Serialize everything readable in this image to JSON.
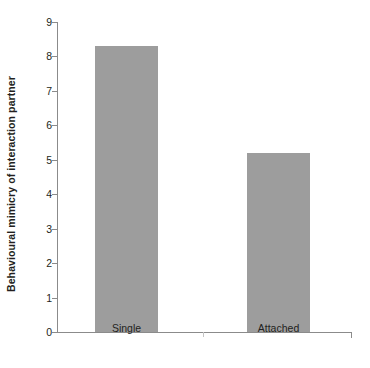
{
  "chart_data": {
    "type": "bar",
    "title": "",
    "xlabel": "",
    "ylabel": "Behavioural mimicry of interaction partner",
    "categories": [
      "Single",
      "Attached"
    ],
    "values": [
      8.3,
      5.2
    ],
    "ylim": [
      0,
      9
    ],
    "y_ticks": [
      0,
      1,
      2,
      3,
      4,
      5,
      6,
      7,
      8,
      9
    ],
    "y_tick_labels": [
      "0",
      "1",
      "2",
      "3",
      "4",
      "5",
      "6",
      "7",
      "8",
      "9"
    ],
    "grid": false,
    "legend": false,
    "bar_color": "#9d9d9d",
    "axis_color": "#8b8b8b",
    "text_color": "#231f20"
  },
  "axes": {
    "y_title": "Behavioural mimicry of interaction partner"
  }
}
